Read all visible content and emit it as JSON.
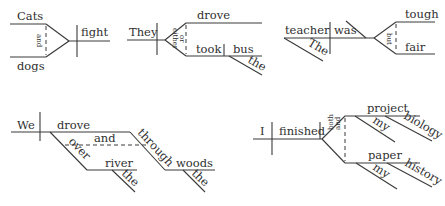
{
  "diagrams": [
    {
      "id": "cats-and-dogs-fight",
      "subjects": [
        "Cats",
        "dogs"
      ],
      "conjunction": "and",
      "verb": "fight"
    },
    {
      "id": "they-drove-or-took-bus",
      "subject": "They",
      "verbs": [
        "drove",
        "took"
      ],
      "conjunction": [
        "either",
        "or"
      ],
      "object": "bus",
      "modifier": "the"
    },
    {
      "id": "teacher-tough-but-fair",
      "subject": "teacher",
      "subject_modifier": "The",
      "verb": "was",
      "complements": [
        "tough",
        "fair"
      ],
      "conjunction": "but"
    },
    {
      "id": "we-drove-over-and-through",
      "subject": "We",
      "verb": "drove",
      "prepositions": [
        "over",
        "through"
      ],
      "conjunction": "and",
      "objects": [
        "river",
        "woods"
      ],
      "modifiers": [
        "the",
        "the"
      ]
    },
    {
      "id": "i-finished-project-and-paper",
      "subject": "I",
      "verb": "finished",
      "conjunction": [
        "both",
        "and"
      ],
      "objects": [
        "project",
        "paper"
      ],
      "object_modifiers": [
        [
          "my",
          "biology"
        ],
        [
          "my",
          "history"
        ]
      ]
    }
  ]
}
